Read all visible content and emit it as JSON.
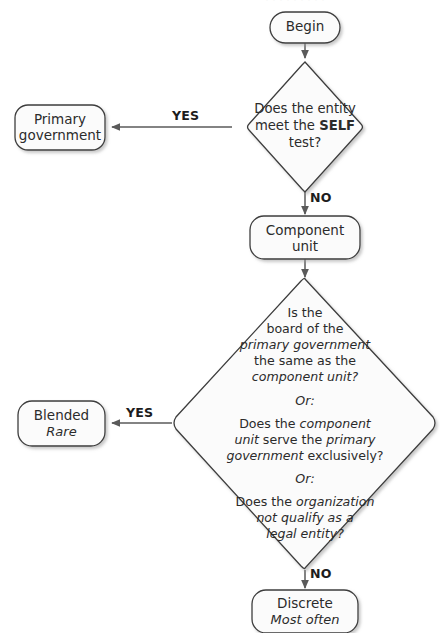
{
  "diagram": {
    "type": "flowchart",
    "colors": {
      "background": "#ffffff",
      "node_fill": "#fbfbfb",
      "node_stroke": "#3d3d3d",
      "shadow": "#c9c9c9",
      "text": "#2b2b2b",
      "edge_line": "#5a5a5a",
      "edge_label": "#1d1d1d"
    },
    "nodes": {
      "begin": {
        "shape": "terminator",
        "label": "Begin"
      },
      "self_test": {
        "shape": "decision",
        "line1": "Does the entity",
        "line2_prefix": "meet the ",
        "line2_bold": "SELF",
        "line3": "test?"
      },
      "primary_government": {
        "shape": "terminator",
        "line1": "Primary",
        "line2": "government"
      },
      "component_unit": {
        "shape": "terminator",
        "line1": "Component",
        "line2": "unit"
      },
      "blended_decision": {
        "shape": "decision",
        "block1": [
          {
            "text": "Is the",
            "italic": false
          },
          {
            "text": "board of the",
            "italic": false
          },
          {
            "text": "primary government",
            "italic": true
          },
          {
            "text": "the same as the",
            "italic": false
          },
          {
            "text": "component unit?",
            "italic": true
          }
        ],
        "or1": "Or:",
        "block2_lines": [
          [
            {
              "text": "Does the ",
              "italic": false
            },
            {
              "text": "component",
              "italic": true
            }
          ],
          [
            {
              "text": "unit",
              "italic": true
            },
            {
              "text": " serve the ",
              "italic": false
            },
            {
              "text": "primary",
              "italic": true
            }
          ],
          [
            {
              "text": "government",
              "italic": true
            },
            {
              "text": " exclusively?",
              "italic": false
            }
          ]
        ],
        "or2": "Or:",
        "block3_lines": [
          [
            {
              "text": "Does the ",
              "italic": false
            },
            {
              "text": "organization",
              "italic": true
            }
          ],
          [
            {
              "text": "not qualify as a",
              "italic": true
            }
          ],
          [
            {
              "text": "legal entity?",
              "italic": true
            }
          ]
        ]
      },
      "blended": {
        "shape": "terminator",
        "main": "Blended",
        "sub": "Rare"
      },
      "discrete": {
        "shape": "terminator",
        "main": "Discrete",
        "sub": "Most often"
      }
    },
    "edges": {
      "begin_to_self": {
        "label": ""
      },
      "self_yes": {
        "label": "YES"
      },
      "self_no": {
        "label": "NO"
      },
      "component_to_blended_decision": {
        "label": ""
      },
      "blended_yes": {
        "label": "YES"
      },
      "blended_no": {
        "label": "NO"
      }
    },
    "cut_off_header": "‧ ‧ ‧ ‧ ‧ ‧ ‧ ‧ ‧"
  }
}
